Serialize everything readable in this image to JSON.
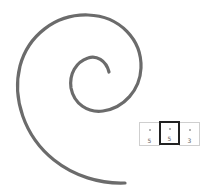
{
  "spiral": {
    "stroke_color": "#6b6b6b",
    "stroke_width": 3.2
  },
  "cells": [
    {
      "dot": "•",
      "value": "5",
      "selected": false
    },
    {
      "dot": "•",
      "value": "5",
      "selected": true
    },
    {
      "dot": "•",
      "value": "3",
      "selected": false
    }
  ],
  "colors": {
    "selected_border": "#222222",
    "cell_border": "#cfcfcf",
    "digit": "#666666"
  }
}
